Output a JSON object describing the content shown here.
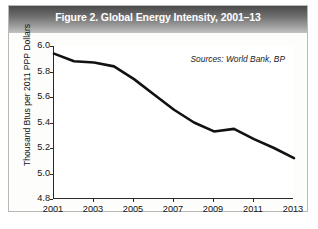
{
  "figure": {
    "title": "Figure 2. Global Energy Intensity, 2001–13",
    "source_note": "Sources: World Bank, BP"
  },
  "chart_data": {
    "type": "line",
    "title": "Figure 2. Global Energy Intensity, 2001–13",
    "xlabel": "",
    "ylabel": "Thousand Btus per 2011 PPP Dollars",
    "annotation": "Sources: World Bank, BP",
    "x": [
      2001,
      2002,
      2003,
      2004,
      2005,
      2006,
      2007,
      2008,
      2009,
      2010,
      2011,
      2012,
      2013
    ],
    "values": [
      5.94,
      5.88,
      5.87,
      5.84,
      5.74,
      5.62,
      5.5,
      5.4,
      5.33,
      5.35,
      5.27,
      5.2,
      5.12
    ],
    "xlim": [
      2001,
      2013
    ],
    "ylim": [
      4.8,
      6.0
    ],
    "y_ticks": [
      "4.8",
      "5.0",
      "5.2",
      "5.4",
      "5.6",
      "5.8",
      "6.0"
    ],
    "x_ticks": [
      "2001",
      "2003",
      "2005",
      "2007",
      "2009",
      "2011",
      "2013"
    ],
    "grid": false,
    "legend": "none",
    "line_color": "#111111",
    "line_width": 2.6
  }
}
